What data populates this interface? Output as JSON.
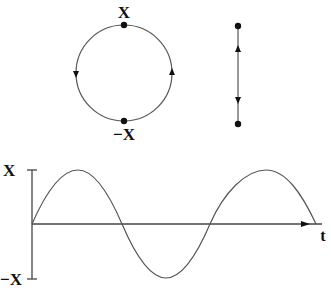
{
  "diagram": {
    "circle": {
      "top_label": "X",
      "bottom_label": "−X",
      "direction": "counterclockwise"
    },
    "projection_line": {
      "arrows": [
        "up",
        "down"
      ]
    },
    "graph": {
      "y_tick_top": "X",
      "y_tick_bottom": "−X",
      "x_axis_label": "t",
      "curve": "sine"
    }
  },
  "colors": {
    "line": "#555555",
    "text": "#111111",
    "background": "#ffffff"
  }
}
